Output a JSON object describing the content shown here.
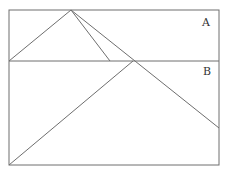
{
  "diagram": {
    "labels": {
      "region_a": "A",
      "region_b": "B"
    },
    "stroke_color": "#6e6e6e",
    "outer_rect": {
      "x1": 9,
      "y1": 10,
      "x2": 219,
      "y2": 165
    },
    "divider_y": 61,
    "apex": {
      "x": 71,
      "y": 10
    },
    "lines": [
      {
        "name": "apex-to-left",
        "x1": 71,
        "y1": 10,
        "x2": 9,
        "y2": 61
      },
      {
        "name": "apex-to-divider",
        "x1": 71,
        "y1": 10,
        "x2": 110,
        "y2": 61
      },
      {
        "name": "apex-to-right-edge",
        "x1": 71,
        "y1": 10,
        "x2": 219,
        "y2": 128
      },
      {
        "name": "bottom-left-to-divider",
        "x1": 9,
        "y1": 165,
        "x2": 133,
        "y2": 61
      }
    ]
  }
}
